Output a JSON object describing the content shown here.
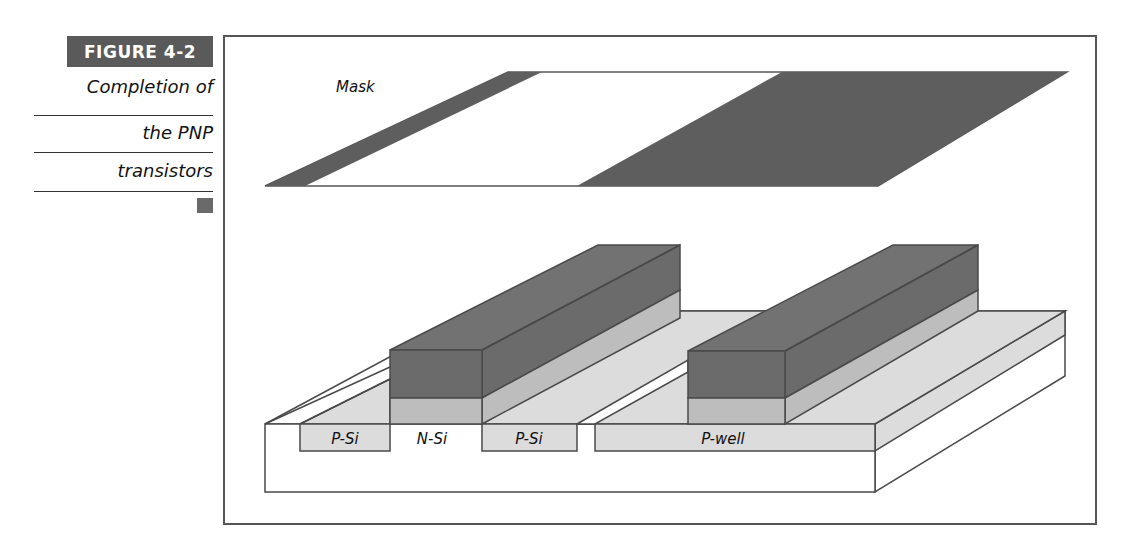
{
  "figure": {
    "label": "FIGURE  4-2",
    "caption_lines": [
      "Completion of",
      "the PNP",
      "transistors"
    ]
  },
  "diagram": {
    "mask_label": "Mask",
    "regions": {
      "p_si_left": "P-Si",
      "n_si": "N-Si",
      "p_si_right": "P-Si",
      "p_well": "P-well"
    },
    "colors": {
      "dark_fill": "#6b6b6b",
      "mid_fill": "#bdbdbd",
      "light_fill": "#dcdcdc",
      "outline": "#4a4a4a",
      "label_bg": "#5a5a5a"
    }
  }
}
